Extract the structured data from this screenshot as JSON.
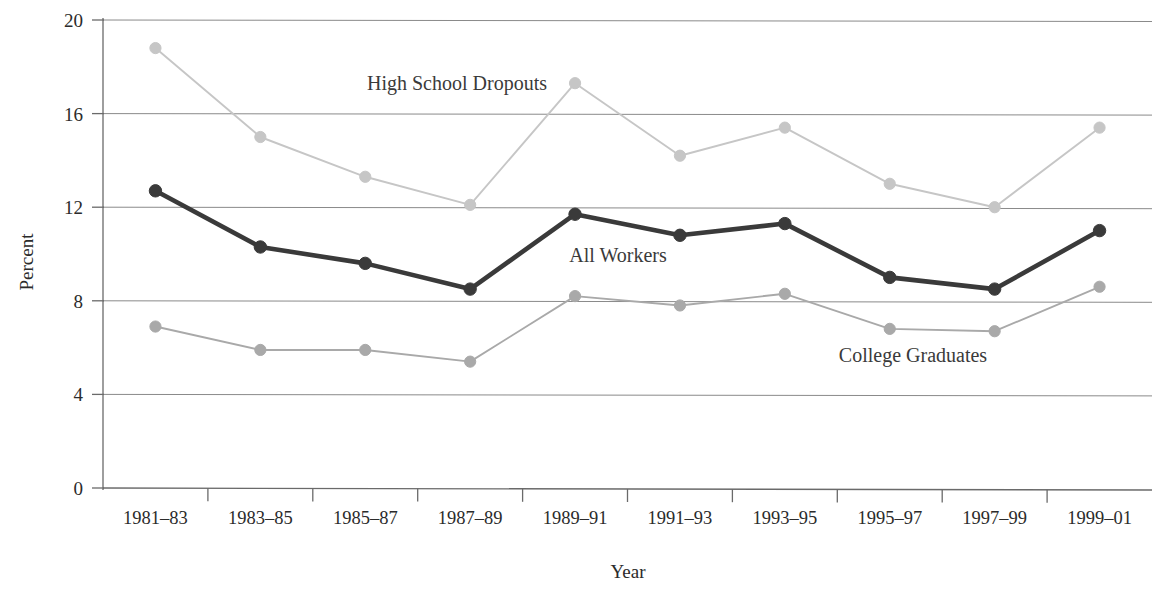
{
  "chart_data": {
    "type": "line",
    "title": "",
    "subtitle": "",
    "xlabel": "Year",
    "ylabel": "Percent",
    "categories": [
      "1981–83",
      "1983–85",
      "1985–87",
      "1987–89",
      "1989–91",
      "1991–93",
      "1993–95",
      "1995–97",
      "1997–99",
      "1999–01"
    ],
    "series": [
      {
        "name": "High School Dropouts",
        "color": "#c6c6c6",
        "values": [
          18.8,
          15.0,
          13.3,
          12.1,
          17.3,
          14.2,
          15.4,
          13.0,
          12.0,
          15.4
        ]
      },
      {
        "name": "All Workers",
        "color": "#3a3a3a",
        "values": [
          12.7,
          10.3,
          9.6,
          8.5,
          11.7,
          10.8,
          11.3,
          9.0,
          8.5,
          11.0
        ]
      },
      {
        "name": "College Graduates",
        "color": "#a9a9a9",
        "values": [
          6.9,
          5.9,
          5.9,
          5.4,
          8.2,
          7.8,
          8.3,
          6.8,
          6.7,
          8.6
        ]
      }
    ],
    "ylim": [
      0,
      20
    ],
    "yticks": [
      0,
      4,
      8,
      12,
      16,
      20
    ],
    "ytick_labels": [
      "0",
      "4",
      "8",
      "12",
      "16",
      "20"
    ],
    "grid": true,
    "grid_axis": "y",
    "legend": "inline-annotations",
    "legend_position": "inside-plot",
    "marker": "circle"
  },
  "axes": {
    "y_title": "Percent",
    "x_title": "Year",
    "y_tick_labels": [
      "20",
      "16",
      "12",
      "8",
      "4",
      "0"
    ],
    "x_tick_labels": [
      "1981–83",
      "1983–85",
      "1985–87",
      "1987–89",
      "1989–91",
      "1991–93",
      "1993–95",
      "1995–97",
      "1997–99",
      "1999–01"
    ]
  },
  "annotations": [
    {
      "id": "dropouts",
      "label": "High School Dropouts"
    },
    {
      "id": "all-workers",
      "label": "All Workers"
    },
    {
      "id": "college-graduates",
      "label": "College Graduates"
    }
  ],
  "colors": {
    "dropouts": "#c6c6c6",
    "all_workers": "#3a3a3a",
    "college_graduates": "#a9a9a9",
    "axis": "#6a6a6a",
    "grid": "#8a8a8a",
    "text": "#2b2b2b",
    "background": "#ffffff"
  }
}
